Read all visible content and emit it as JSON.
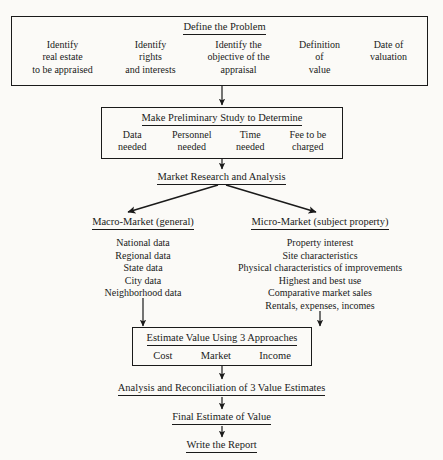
{
  "diagram": {
    "stages": {
      "define_problem": {
        "header": "Define the Problem",
        "columns": [
          "Identify\nreal estate\nto be appraised",
          "Identify\nrights\nand interests",
          "Identify the\nobjective of the\nappraisal",
          "Definition\nof\nvalue",
          "Date of\nvaluation"
        ]
      },
      "preliminary_study": {
        "header": "Make Preliminary Study to Determine",
        "columns": [
          "Data\nneeded",
          "Personnel\nneeded",
          "Time\nneeded",
          "Fee to be\ncharged"
        ]
      },
      "market_research": {
        "label": "Market Research and Analysis"
      },
      "macro_market": {
        "header": "Macro-Market (general)",
        "items": [
          "National data",
          "Regional data",
          "State data",
          "City data",
          "Neighborhood data"
        ]
      },
      "micro_market": {
        "header": "Micro-Market (subject property)",
        "items": [
          "Property interest",
          "Site characteristics",
          "Physical characteristics of improvements",
          "Highest and best use",
          "Comparative market sales",
          "Rentals, expenses, incomes"
        ]
      },
      "estimate_value": {
        "header": "Estimate Value Using 3 Approaches",
        "approaches": [
          "Cost",
          "Market",
          "Income"
        ]
      },
      "analysis_reconciliation": {
        "label": "Analysis and Reconciliation of 3 Value Estimates"
      },
      "final_estimate": {
        "label": "Final Estimate of Value"
      },
      "write_report": {
        "label": "Write the Report"
      }
    },
    "colors": {
      "ink": "#1a1a1a",
      "paper": "#fbfaf7"
    }
  }
}
